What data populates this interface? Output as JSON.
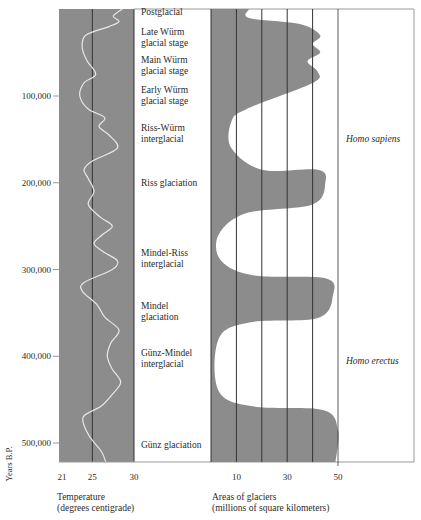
{
  "chart_data": {
    "type": "area",
    "title": "",
    "y_axis": {
      "label": "Years B.P.",
      "ticks": [
        {
          "label": "100,000",
          "value": 100000
        },
        {
          "label": "200,000",
          "value": 200000
        },
        {
          "label": "300,000",
          "value": 300000
        },
        {
          "label": "400,000",
          "value": 400000
        },
        {
          "label": "500,000",
          "value": 500000
        }
      ],
      "range": [
        0,
        530000
      ],
      "inverted": true
    },
    "panels": [
      {
        "name": "temperature",
        "type": "line",
        "xlabel_line1": "Temperature",
        "xlabel_line2": "(degrees centigrade)",
        "x_ticks": [
          {
            "label": "21",
            "value": 21
          },
          {
            "label": "25",
            "value": 25
          },
          {
            "label": "30",
            "value": 30
          }
        ],
        "xlim": [
          21,
          30
        ],
        "series": [
          {
            "name": "Temperature",
            "points": [
              [
                28.6,
                0
              ],
              [
                27.5,
                8000
              ],
              [
                28.2,
                14000
              ],
              [
                27.0,
                20000
              ],
              [
                24.2,
                30000
              ],
              [
                23.8,
                45000
              ],
              [
                24.4,
                60000
              ],
              [
                25.4,
                75000
              ],
              [
                24.0,
                85000
              ],
              [
                23.5,
                100000
              ],
              [
                24.5,
                115000
              ],
              [
                26.5,
                125000
              ],
              [
                25.8,
                135000
              ],
              [
                27.0,
                145000
              ],
              [
                28.0,
                160000
              ],
              [
                25.0,
                175000
              ],
              [
                24.0,
                185000
              ],
              [
                24.5,
                195000
              ],
              [
                25.2,
                210000
              ],
              [
                24.5,
                225000
              ],
              [
                26.0,
                240000
              ],
              [
                27.4,
                250000
              ],
              [
                26.2,
                260000
              ],
              [
                25.2,
                270000
              ],
              [
                26.4,
                280000
              ],
              [
                28.0,
                290000
              ],
              [
                27.4,
                300000
              ],
              [
                24.0,
                315000
              ],
              [
                23.8,
                325000
              ],
              [
                25.5,
                340000
              ],
              [
                26.5,
                355000
              ],
              [
                28.2,
                370000
              ],
              [
                27.2,
                385000
              ],
              [
                26.8,
                400000
              ],
              [
                27.4,
                415000
              ],
              [
                28.4,
                430000
              ],
              [
                27.3,
                445000
              ],
              [
                26.0,
                458000
              ],
              [
                23.9,
                470000
              ],
              [
                24.5,
                490000
              ],
              [
                26.1,
                510000
              ],
              [
                26.6,
                528000
              ]
            ]
          }
        ]
      },
      {
        "name": "glacier-area",
        "type": "area",
        "xlabel_line1": "Areas of glaciers",
        "xlabel_line2": "(millions of square kilometers)",
        "x_ticks": [
          {
            "label": "10",
            "value": 10
          },
          {
            "label": "30",
            "value": 30
          },
          {
            "label": "50",
            "value": 50
          }
        ],
        "gridlines": [
          0,
          10,
          20,
          30,
          40,
          50
        ],
        "xlim": [
          0,
          50
        ],
        "series": [
          {
            "name": "Glacier area",
            "points": [
              [
                15,
                0
              ],
              [
                15,
                10000
              ],
              [
                35,
                17000
              ],
              [
                43,
                30000
              ],
              [
                40,
                40000
              ],
              [
                43,
                50000
              ],
              [
                38,
                60000
              ],
              [
                42,
                72000
              ],
              [
                40,
                85000
              ],
              [
                14,
                115000
              ],
              [
                8,
                130000
              ],
              [
                8,
                160000
              ],
              [
                20,
                185000
              ],
              [
                42,
                185000
              ],
              [
                45,
                200000
              ],
              [
                40,
                225000
              ],
              [
                14,
                235000
              ],
              [
                3,
                260000
              ],
              [
                4,
                290000
              ],
              [
                17,
                307000
              ],
              [
                45,
                310000
              ],
              [
                48,
                330000
              ],
              [
                42,
                356000
              ],
              [
                15,
                361000
              ],
              [
                3,
                380000
              ],
              [
                3,
                440000
              ],
              [
                17,
                458000
              ],
              [
                44,
                462000
              ],
              [
                50,
                485000
              ],
              [
                49,
                528000
              ]
            ]
          }
        ]
      }
    ],
    "stage_labels": [
      {
        "text": [
          "Postglacial"
        ],
        "year": 3000
      },
      {
        "text": [
          "Late Würm",
          "glacial stage"
        ],
        "year": 30000
      },
      {
        "text": [
          "Main Würm",
          "glacial stage"
        ],
        "year": 62000
      },
      {
        "text": [
          "Early Würm",
          "glacial stage"
        ],
        "year": 96000
      },
      {
        "text": [
          "Riss-Würm",
          "interglacial"
        ],
        "year": 140000
      },
      {
        "text": [
          "Riss glaciation"
        ],
        "year": 200000
      },
      {
        "text": [
          "Mindel-Riss",
          "interglacial"
        ],
        "year": 285000
      },
      {
        "text": [
          "Mindel",
          "glaciation"
        ],
        "year": 345000
      },
      {
        "text": [
          "Günz-Mindel",
          "interglacial"
        ],
        "year": 400000
      },
      {
        "text": [
          "Günz glaciation"
        ],
        "year": 502000
      }
    ],
    "species_labels": [
      {
        "text": "Homo sapiens",
        "year": 150000
      },
      {
        "text": "Homo erectus",
        "year": 405000
      }
    ],
    "colors": {
      "panel_gray": "#8c8c8c",
      "curve": "#e8e8e8",
      "grid": "#333333",
      "frame": "#9a9a9a",
      "text": "#2b2b2b"
    }
  }
}
